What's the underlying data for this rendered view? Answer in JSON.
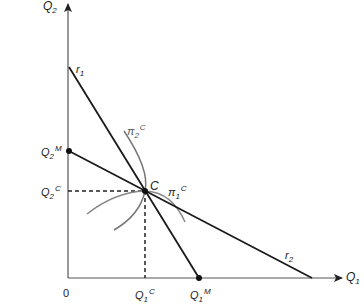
{
  "diagram": {
    "type": "cournot-reaction-functions",
    "colors": {
      "axis": "#555555",
      "line": "#1a1a1a",
      "curve": "#777777",
      "text": "#222222"
    },
    "axes": {
      "x_label": {
        "base": "Q",
        "sub": "1"
      },
      "y_label": {
        "base": "Q",
        "sub": "2"
      },
      "origin_label": "0"
    },
    "lines": {
      "r1": {
        "base": "r",
        "sub": "1"
      },
      "r2": {
        "base": "r",
        "sub": "2"
      }
    },
    "curves": {
      "pi1": {
        "base": "π",
        "sub": "1",
        "sup": "C"
      },
      "pi2": {
        "base": "π",
        "sub": "2",
        "sup": "C"
      }
    },
    "points": {
      "C": "C",
      "Q2M": {
        "base": "Q",
        "sub": "2",
        "sup": "M"
      },
      "Q2C": {
        "base": "Q",
        "sub": "2",
        "sup": "C"
      },
      "Q1C": {
        "base": "Q",
        "sub": "1",
        "sup": "C"
      },
      "Q1M": {
        "base": "Q",
        "sub": "1",
        "sup": "M"
      }
    }
  }
}
